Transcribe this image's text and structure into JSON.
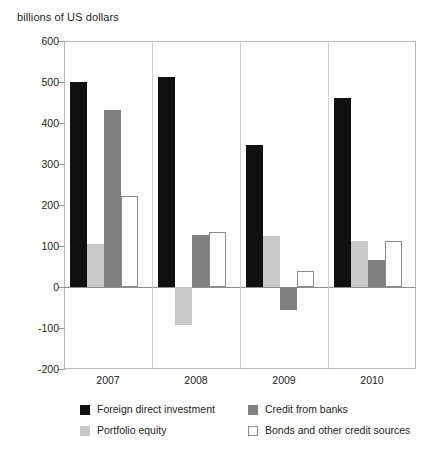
{
  "chart_data": {
    "type": "bar",
    "title": "billions of US dollars",
    "xlabel": "",
    "ylabel": "billions of US dollars",
    "categories": [
      "2007",
      "2008",
      "2009",
      "2010"
    ],
    "ylim": [
      -200,
      600
    ],
    "yticks": [
      600,
      500,
      400,
      300,
      200,
      100,
      0,
      -100,
      -200
    ],
    "ytick_labels": [
      "600",
      "500",
      "400",
      "300",
      "200",
      "100",
      "0",
      "-100",
      "-200"
    ],
    "grid": false,
    "legend_position": "bottom",
    "series": [
      {
        "name": "Foreign direct investment",
        "color": "#111111",
        "style": "solid",
        "values": [
          500,
          512,
          347,
          462
        ]
      },
      {
        "name": "Portfolio equity",
        "color": "#c9c9c9",
        "style": "solid",
        "values": [
          105,
          -93,
          125,
          113
        ]
      },
      {
        "name": "Credit from banks",
        "color": "#808080",
        "style": "solid",
        "values": [
          431,
          128,
          -57,
          65
        ]
      },
      {
        "name": "Bonds and other credit sources",
        "color": "#ffffff",
        "style": "outlined",
        "values": [
          221,
          133,
          38,
          113
        ]
      }
    ]
  },
  "axis": {
    "title": "billions of US dollars"
  },
  "legend": {
    "entries": [
      {
        "label": "Foreign direct investment",
        "swatch": "fdi"
      },
      {
        "label": "Portfolio equity",
        "swatch": "portfolio"
      },
      {
        "label": "Credit from banks",
        "swatch": "credit"
      },
      {
        "label": "Bonds and other credit sources",
        "swatch": "bonds"
      }
    ]
  }
}
